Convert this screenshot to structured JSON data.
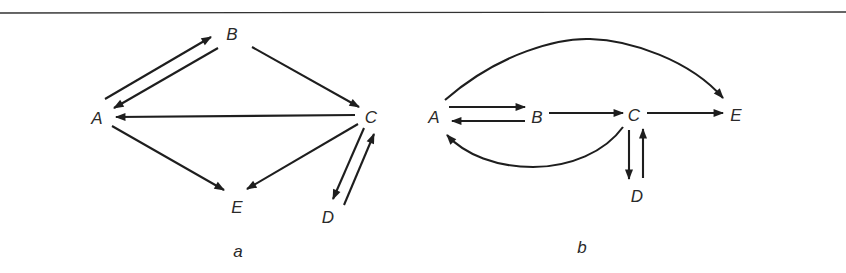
{
  "figure": {
    "rule_color": "#333333",
    "ink_color": "#1e1e1e",
    "panels": [
      {
        "id": "a",
        "label": "a",
        "nodes": [
          {
            "id": "A",
            "label": "A",
            "x": 97,
            "y": 124
          },
          {
            "id": "B",
            "label": "B",
            "x": 232,
            "y": 40
          },
          {
            "id": "C",
            "label": "C",
            "x": 370,
            "y": 123
          },
          {
            "id": "D",
            "label": "D",
            "x": 328,
            "y": 223
          },
          {
            "id": "E",
            "label": "E",
            "x": 237,
            "y": 213
          }
        ],
        "edges": [
          {
            "from": "A",
            "to": "B"
          },
          {
            "from": "B",
            "to": "A"
          },
          {
            "from": "B",
            "to": "C"
          },
          {
            "from": "C",
            "to": "A"
          },
          {
            "from": "A",
            "to": "E"
          },
          {
            "from": "C",
            "to": "E"
          },
          {
            "from": "C",
            "to": "D"
          },
          {
            "from": "D",
            "to": "C"
          }
        ]
      },
      {
        "id": "b",
        "label": "b",
        "nodes": [
          {
            "id": "A",
            "label": "A",
            "x": 434,
            "y": 123
          },
          {
            "id": "B",
            "label": "B",
            "x": 537,
            "y": 123
          },
          {
            "id": "C",
            "label": "C",
            "x": 633,
            "y": 121
          },
          {
            "id": "D",
            "label": "D",
            "x": 637,
            "y": 202
          },
          {
            "id": "E",
            "label": "E",
            "x": 735,
            "y": 121
          }
        ],
        "edges": [
          {
            "from": "A",
            "to": "E",
            "shape": "arc-over"
          },
          {
            "from": "A",
            "to": "B"
          },
          {
            "from": "B",
            "to": "A"
          },
          {
            "from": "B",
            "to": "C"
          },
          {
            "from": "C",
            "to": "E"
          },
          {
            "from": "C",
            "to": "A",
            "shape": "arc-under"
          },
          {
            "from": "C",
            "to": "D"
          },
          {
            "from": "D",
            "to": "C"
          }
        ]
      }
    ]
  }
}
